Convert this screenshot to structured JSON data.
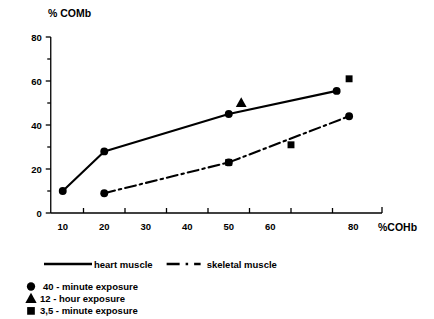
{
  "chart_data": {
    "type": "line",
    "title": "",
    "xlabel": "%COHb",
    "ylabel": "% COMb",
    "xlim": [
      5,
      85
    ],
    "ylim": [
      0,
      80
    ],
    "grid": false,
    "legend_position": "below-plot",
    "x_ticks": [
      10,
      20,
      30,
      40,
      50,
      60,
      70,
      80
    ],
    "x_tick_labels": [
      "10",
      "20",
      "30",
      "40",
      "50",
      "60",
      "",
      "80"
    ],
    "y_ticks": [
      0,
      10,
      20,
      30,
      40,
      50,
      60,
      70,
      80
    ],
    "y_tick_labels": [
      "0",
      "",
      "20",
      "",
      "40",
      "",
      "60",
      "",
      "80"
    ],
    "series": [
      {
        "name": "heart muscle",
        "linestyle": "solid",
        "color": "#000000",
        "x": [
          10,
          20,
          50,
          76
        ],
        "y": [
          10,
          28,
          45,
          55.5
        ],
        "points": [
          {
            "x": 10,
            "y": 10,
            "marker": "circle"
          },
          {
            "x": 20,
            "y": 28,
            "marker": "circle"
          },
          {
            "x": 50,
            "y": 45,
            "marker": "circle"
          },
          {
            "x": 76,
            "y": 55.5,
            "marker": "circle"
          }
        ]
      },
      {
        "name": "skeletal muscle",
        "linestyle": "dashdot",
        "color": "#000000",
        "x": [
          20,
          50,
          79
        ],
        "y": [
          9,
          23,
          44
        ],
        "points": [
          {
            "x": 20,
            "y": 9,
            "marker": "circle"
          },
          {
            "x": 50,
            "y": 23,
            "marker": "circle"
          },
          {
            "x": 79,
            "y": 44,
            "marker": "circle"
          }
        ]
      }
    ],
    "extra_points": [
      {
        "x": 53,
        "y": 50,
        "marker": "triangle",
        "series": "heart muscle"
      },
      {
        "x": 79,
        "y": 61,
        "marker": "square",
        "series": "heart muscle"
      },
      {
        "x": 50,
        "y": 23,
        "marker": "square",
        "series": "skeletal muscle"
      },
      {
        "x": 65,
        "y": 31,
        "marker": "square",
        "series": "skeletal muscle"
      }
    ]
  },
  "axis": {
    "y_title": "% COMb",
    "x_title": "%COHb"
  },
  "line_legend": [
    {
      "label": "heart muscle",
      "style": "solid"
    },
    {
      "label": "skeletal muscle",
      "style": "dashdot"
    }
  ],
  "marker_legend": [
    {
      "marker": "circle",
      "label": "40 - minute exposure"
    },
    {
      "marker": "triangle",
      "label": "12 - hour exposure"
    },
    {
      "marker": "square",
      "label": "3,5 - minute exposure"
    }
  ]
}
